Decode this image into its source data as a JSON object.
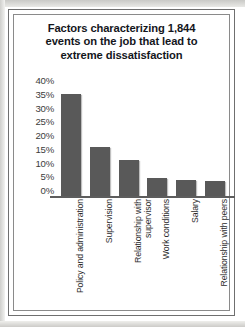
{
  "figure": {
    "title": "Factors characterizing 1,844 events on the job that lead to extreme dissatisfaction",
    "title_line1": "Factors characterizing 1,844",
    "title_line2": "events on the job that lead to",
    "title_line3": "extreme dissatisfaction",
    "frame_color": "#6f6f6f",
    "background_color": "#ffffff"
  },
  "chart_data": {
    "type": "bar",
    "title": "Factors characterizing 1,844 events on the job that lead to extreme dissatisfaction",
    "xlabel": "",
    "ylabel": "",
    "categories": [
      "Policy and administration",
      "Supervision",
      "Relationship with supervisor",
      "Work conditions",
      "Salary",
      "Relationship with peers"
    ],
    "values": [
      37,
      18,
      13,
      6.5,
      6,
      5.5
    ],
    "value_labels": [
      "37%",
      "18%",
      "13%",
      "6.5%",
      "6%",
      "5.5%"
    ],
    "ylim": [
      0,
      40
    ],
    "ytick_values": [
      40,
      35,
      30,
      25,
      20,
      15,
      10,
      5,
      0
    ],
    "ytick_labels": [
      "40%",
      "35%",
      "30%",
      "25%",
      "20%",
      "15%",
      "10%",
      "5%",
      "0%"
    ],
    "grid": false,
    "legend": false,
    "bar_color": "#595959",
    "axis_color": "#5d5d5d"
  },
  "category_label_lines": [
    [
      "Policy and administration"
    ],
    [
      "Supervision"
    ],
    [
      "Relationship with",
      "supervisor"
    ],
    [
      "Work conditions"
    ],
    [
      "Salary"
    ],
    [
      "Relationship with peers"
    ]
  ]
}
